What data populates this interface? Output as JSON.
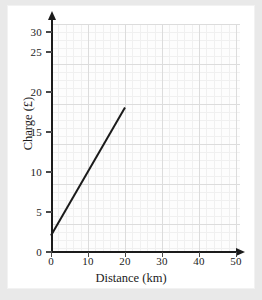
{
  "page": {
    "background_color": "#e9e9e9",
    "sheet_color": "#ffffff"
  },
  "chart_data": {
    "type": "line",
    "title": "",
    "xlabel": "Distance (km)",
    "ylabel": "Charge (£)",
    "xlim": [
      0,
      55
    ],
    "ylim": [
      0,
      32
    ],
    "xticks": [
      0,
      10,
      20,
      30,
      40,
      50
    ],
    "xtick_labels": [
      "0",
      "10",
      "20",
      "30",
      "40",
      "50"
    ],
    "yticks": [
      0,
      5,
      10,
      15,
      20,
      25,
      30
    ],
    "ytick_labels": [
      "0",
      "5",
      "10",
      "15",
      "20",
      "25",
      "30"
    ],
    "grid": true,
    "grid_minor": true,
    "grid_minor_x_step": 2,
    "grid_minor_y_step": 1,
    "legend": false,
    "series": [
      {
        "name": "Charge vs distance",
        "color": "#1b1b1b",
        "line_width": 2,
        "x": [
          0,
          20
        ],
        "y": [
          2,
          18
        ],
        "intercept": 2,
        "slope": 0.8
      }
    ]
  },
  "axes": {
    "y_arrow": "arrow-up-icon",
    "x_arrow": "arrow-right-icon"
  }
}
